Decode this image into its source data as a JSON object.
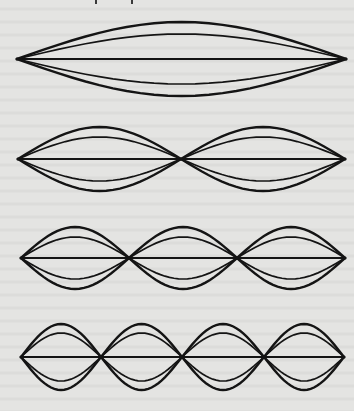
{
  "figure": {
    "stroke_color": "#141414",
    "background_color": "#e4e4e2",
    "modes": [
      {
        "harmonic": 1,
        "label": "fundamental",
        "center_y": 59,
        "nodes_x": [
          17,
          346
        ],
        "outer_amplitude": 37,
        "inner_amplitude": 25
      },
      {
        "harmonic": 2,
        "label": "second harmonic",
        "center_y": 159,
        "nodes_x": [
          18,
          181,
          345
        ],
        "outer_amplitude": 32,
        "inner_amplitude": 22
      },
      {
        "harmonic": 3,
        "label": "third harmonic",
        "center_y": 258,
        "nodes_x": [
          21,
          129,
          237,
          345
        ],
        "outer_amplitude": 31,
        "inner_amplitude": 21
      },
      {
        "harmonic": 4,
        "label": "fourth harmonic",
        "center_y": 357,
        "nodes_x": [
          21,
          101,
          182,
          264,
          344
        ],
        "outer_amplitude": 33,
        "inner_amplitude": 24
      }
    ]
  },
  "page_marks_x": [
    95,
    131
  ]
}
